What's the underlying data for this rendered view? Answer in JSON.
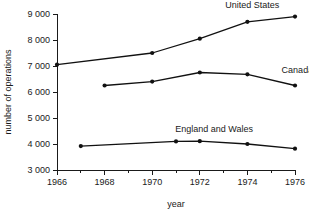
{
  "chart_data": {
    "type": "line",
    "title": "",
    "xlabel": "year",
    "ylabel": "number of operations",
    "xlim": [
      1966,
      1976
    ],
    "ylim": [
      3000,
      9000
    ],
    "grid": false,
    "legend_position": "inline-right",
    "x_ticks": [
      1966,
      1968,
      1970,
      1972,
      1974,
      1976
    ],
    "x_tick_labels": [
      "1966",
      "1968",
      "1970",
      "1972",
      "1974",
      "1976"
    ],
    "x_minor_ticks": [
      1967,
      1969,
      1971,
      1973,
      1975
    ],
    "y_ticks": [
      3000,
      4000,
      5000,
      6000,
      7000,
      8000,
      9000
    ],
    "y_tick_labels": [
      "3 000",
      "4 000",
      "5 000",
      "6 000",
      "7 000",
      "8 000",
      "9 000"
    ],
    "series": [
      {
        "name": "United States",
        "label": "United States",
        "color": "#111111",
        "x": [
          1966,
          1970,
          1972,
          1974,
          1976
        ],
        "values": [
          7050,
          7500,
          8050,
          8700,
          8900
        ],
        "label_x": 1974.2,
        "label_y": 9250
      },
      {
        "name": "Canada",
        "label": "Canada",
        "color": "#111111",
        "x": [
          1968,
          1970,
          1972,
          1974,
          1976
        ],
        "values": [
          6250,
          6400,
          6750,
          6680,
          6250
        ],
        "label_x": 1976.1,
        "label_y": 6720
      },
      {
        "name": "England and Wales",
        "label": "England and Wales",
        "color": "#111111",
        "x": [
          1967,
          1971,
          1972,
          1974,
          1976
        ],
        "values": [
          3920,
          4100,
          4110,
          4000,
          3820
        ],
        "label_x": 1972.6,
        "label_y": 4480
      }
    ]
  }
}
